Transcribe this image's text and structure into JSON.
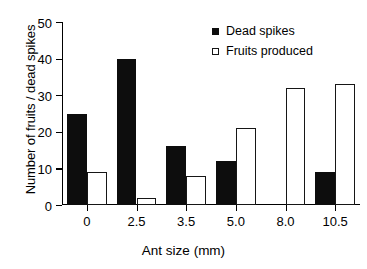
{
  "chart_data": {
    "type": "bar",
    "title": "",
    "xlabel": "Ant size (mm)",
    "ylabel": "Number of fruits / dead spikes",
    "categories": [
      "0",
      "2.5",
      "3.5",
      "5.0",
      "8.0",
      "10.5"
    ],
    "series": [
      {
        "name": "Dead spikes",
        "values": [
          25,
          40,
          16,
          12,
          0,
          9
        ],
        "style": "filled",
        "color": "#0d0d0d"
      },
      {
        "name": "Fruits produced",
        "values": [
          9,
          2,
          8,
          21,
          32,
          33
        ],
        "style": "open",
        "color": "#ffffff"
      }
    ],
    "ylim": [
      0,
      50
    ],
    "yticks": [
      "0",
      "10",
      "20",
      "30",
      "40",
      "50"
    ],
    "ytick_values": [
      0,
      10,
      20,
      30,
      40,
      50
    ],
    "grid": false,
    "legend_position": "top-right"
  },
  "legend": {
    "items": [
      {
        "label": "Dead spikes",
        "marker": "filled-square-icon"
      },
      {
        "label": "Fruits produced",
        "marker": "open-square-icon"
      }
    ]
  }
}
